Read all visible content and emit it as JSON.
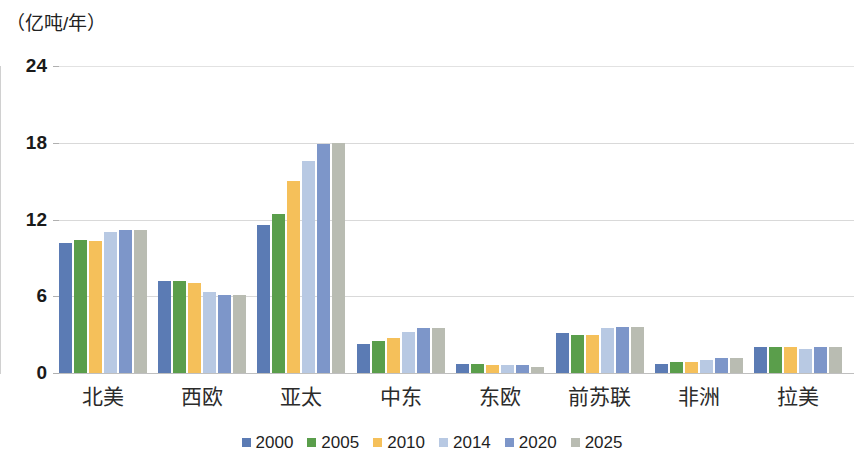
{
  "unit_label": "（亿吨/年）",
  "chart_data": {
    "type": "bar",
    "title": "",
    "subtitle": "",
    "xlabel": "",
    "ylabel": "（亿吨/年）",
    "ylim": [
      0,
      24
    ],
    "yticks": [
      0,
      6,
      12,
      18,
      24
    ],
    "grid": true,
    "legend_position": "bottom",
    "categories": [
      "北美",
      "西欧",
      "亚太",
      "中东",
      "东欧",
      "前苏联",
      "非洲",
      "拉美"
    ],
    "series": [
      {
        "name": "2000",
        "color": "#5b7bb4",
        "values": [
          10.2,
          7.2,
          11.6,
          2.3,
          0.7,
          3.1,
          0.7,
          2.0
        ]
      },
      {
        "name": "2005",
        "color": "#5a9e4b",
        "values": [
          10.4,
          7.2,
          12.4,
          2.5,
          0.7,
          3.0,
          0.9,
          2.0
        ]
      },
      {
        "name": "2010",
        "color": "#f5c05a",
        "values": [
          10.3,
          7.0,
          15.0,
          2.7,
          0.6,
          3.0,
          0.9,
          2.0
        ]
      },
      {
        "name": "2014",
        "color": "#b8c9e3",
        "values": [
          11.0,
          6.3,
          16.6,
          3.2,
          0.6,
          3.5,
          1.0,
          1.9
        ]
      },
      {
        "name": "2020",
        "color": "#7d96c9",
        "values": [
          11.2,
          6.1,
          17.9,
          3.5,
          0.6,
          3.6,
          1.2,
          2.0
        ]
      },
      {
        "name": "2025",
        "color": "#b9bcb2",
        "values": [
          11.2,
          6.1,
          18.0,
          3.5,
          0.5,
          3.6,
          1.2,
          2.0
        ]
      }
    ]
  }
}
